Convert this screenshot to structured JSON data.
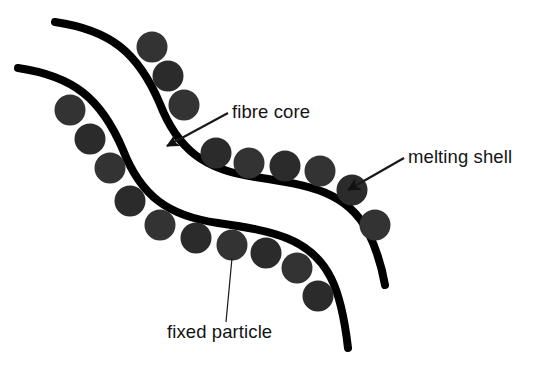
{
  "figure": {
    "background_color": "#ffffff",
    "width": 539,
    "height": 367
  },
  "colors": {
    "fibre_core_stroke": "#000000",
    "particle_fill": "#333333",
    "particle_fill_alt": "#2b2b2b",
    "label_text": "#141414",
    "leader_line": "#1a1a1a",
    "background": "#ffffff"
  },
  "labels": [
    {
      "id": "fibre-core",
      "text": "fibre core",
      "x": 232,
      "y": 118,
      "anchor": "start",
      "leader": {
        "type": "arrow",
        "from_x": 228,
        "from_y": 113,
        "to_x": 167,
        "to_y": 146
      }
    },
    {
      "id": "melting-shell",
      "text": "melting shell",
      "x": 408,
      "y": 163,
      "anchor": "start",
      "leader": {
        "type": "arrow",
        "from_x": 404,
        "from_y": 158,
        "to_x": 348,
        "to_y": 190
      }
    },
    {
      "id": "fixed-particle",
      "text": "fixed particle",
      "x": 167,
      "y": 338,
      "anchor": "start",
      "leader": {
        "type": "line",
        "from_x": 226,
        "from_y": 322,
        "to_x": 232,
        "to_y": 258
      }
    }
  ],
  "fibres": [
    {
      "id": "upper-fibre",
      "name": "upper fibre core",
      "stroke_width": 8,
      "path": "M 55 22 C 110 30 138 52 160 104 C 178 150 205 170 255 177 C 310 185 348 192 368 232 C 378 252 382 268 385 285"
    },
    {
      "id": "lower-fibre",
      "name": "lower fibre core",
      "stroke_width": 8,
      "path": "M 18 68 C 73 76 101 98 123 150 C 141 196 168 216 218 223 C 273 231 311 238 331 278 C 341 298 345 322 348 348"
    }
  ],
  "particles": {
    "radius": 15.5,
    "upper_chain": [
      {
        "cx": 152,
        "cy": 47
      },
      {
        "cx": 168,
        "cy": 76
      },
      {
        "cx": 184,
        "cy": 105
      },
      {
        "cx": 216,
        "cy": 153
      },
      {
        "cx": 249,
        "cy": 163
      },
      {
        "cx": 285,
        "cy": 166
      },
      {
        "cx": 320,
        "cy": 171
      },
      {
        "cx": 352,
        "cy": 190
      },
      {
        "cx": 375,
        "cy": 225
      }
    ],
    "lower_chain": [
      {
        "cx": 70,
        "cy": 110
      },
      {
        "cx": 90,
        "cy": 139
      },
      {
        "cx": 110,
        "cy": 168
      },
      {
        "cx": 130,
        "cy": 201
      },
      {
        "cx": 160,
        "cy": 225
      },
      {
        "cx": 196,
        "cy": 238
      },
      {
        "cx": 232,
        "cy": 245
      },
      {
        "cx": 266,
        "cy": 253
      },
      {
        "cx": 297,
        "cy": 268
      },
      {
        "cx": 318,
        "cy": 296
      }
    ]
  }
}
